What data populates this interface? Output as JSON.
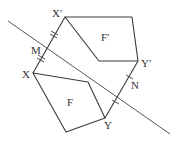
{
  "diagram": {
    "shapes": [
      {
        "name": "F",
        "label": "F"
      },
      {
        "name": "F-prime",
        "label": "F′"
      }
    ],
    "points": {
      "X": "X",
      "X_prime": "X′",
      "Y": "Y",
      "Y_prime": "Y′",
      "M": "M",
      "N": "N"
    },
    "markings": {
      "XM_equals_MXprime": "double tick marks",
      "YN_equals_NYprime": "single tick marks"
    },
    "colors": {
      "stroke": "#3a3a3a",
      "background": "#ffffff"
    }
  }
}
